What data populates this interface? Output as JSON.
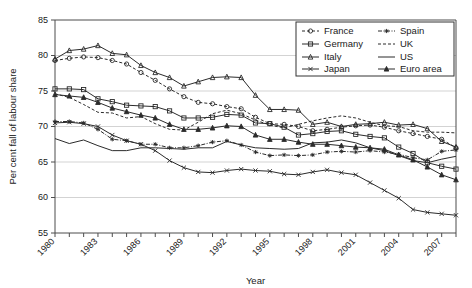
{
  "chart_data": {
    "type": "line",
    "title": "",
    "xlabel": "Year",
    "ylabel": "Per cent fall of labour share",
    "xlim": [
      1980,
      2008
    ],
    "ylim": [
      55,
      85
    ],
    "yticks": [
      55,
      60,
      65,
      70,
      75,
      80,
      85
    ],
    "xticks": [
      1980,
      1981,
      1982,
      1983,
      1984,
      1985,
      1986,
      1987,
      1988,
      1989,
      1990,
      1991,
      1992,
      1993,
      1994,
      1995,
      1996,
      1997,
      1998,
      1999,
      2000,
      2001,
      2002,
      2003,
      2004,
      2005,
      2006,
      2007,
      2008
    ],
    "xtick_labels": [
      "1980",
      "",
      "",
      "1983",
      "",
      "",
      "1986",
      "",
      "",
      "1989",
      "",
      "",
      "1992",
      "",
      "",
      "1995",
      "",
      "",
      "1998",
      "",
      "",
      "2001",
      "",
      "",
      "2004",
      "",
      "",
      "2007",
      ""
    ],
    "grid": "horizontal",
    "legend_position": "top-right",
    "x": [
      1980,
      1981,
      1982,
      1983,
      1984,
      1985,
      1986,
      1987,
      1988,
      1989,
      1990,
      1991,
      1992,
      1993,
      1994,
      1995,
      1996,
      1997,
      1998,
      1999,
      2000,
      2001,
      2002,
      2003,
      2004,
      2005,
      2006,
      2007,
      2008
    ],
    "series": [
      {
        "name": "France",
        "marker": "circle-open",
        "line_style": "dashed",
        "values": [
          79.3,
          79.6,
          79.8,
          79.7,
          79.3,
          78.8,
          77.6,
          76.5,
          75.3,
          74.2,
          73.4,
          73.2,
          72.8,
          72.5,
          71.3,
          70.4,
          70.3,
          70.0,
          69.4,
          69.6,
          69.9,
          70.1,
          70.2,
          69.9,
          69.4,
          69.0,
          68.6,
          68.2,
          67.0
        ]
      },
      {
        "name": "Germany",
        "marker": "square-open",
        "line_style": "solid",
        "values": [
          75.3,
          75.3,
          75.2,
          73.9,
          73.5,
          73.0,
          72.9,
          72.8,
          72.2,
          71.2,
          71.2,
          71.3,
          71.7,
          71.6,
          70.5,
          70.4,
          69.9,
          68.8,
          69.0,
          69.3,
          69.4,
          68.9,
          68.6,
          68.4,
          67.1,
          66.2,
          64.9,
          64.4,
          64.0
        ]
      },
      {
        "name": "Italy",
        "marker": "triangle-open",
        "line_style": "solid",
        "values": [
          79.5,
          80.7,
          80.9,
          81.4,
          80.3,
          80.1,
          78.6,
          77.6,
          76.9,
          75.7,
          76.3,
          76.9,
          77.0,
          76.9,
          74.4,
          72.4,
          72.4,
          72.3,
          70.3,
          70.6,
          70.0,
          70.3,
          70.4,
          70.6,
          70.2,
          70.3,
          69.7,
          67.9,
          67.1
        ]
      },
      {
        "name": "Japan",
        "marker": "x",
        "line_style": "solid",
        "values": [
          70.5,
          70.6,
          70.4,
          70.0,
          68.8,
          68.0,
          67.5,
          66.6,
          65.2,
          64.2,
          63.6,
          63.5,
          63.8,
          64.0,
          63.8,
          63.7,
          63.3,
          63.2,
          63.6,
          63.9,
          63.5,
          63.2,
          62.1,
          61.0,
          59.9,
          58.3,
          57.9,
          57.7,
          57.5
        ]
      },
      {
        "name": "Spain",
        "marker": "star",
        "line_style": "dash-dot",
        "values": [
          70.7,
          70.7,
          70.5,
          69.6,
          68.2,
          68.0,
          67.5,
          67.5,
          67.0,
          67.0,
          67.3,
          67.8,
          68.0,
          67.4,
          66.4,
          65.9,
          66.0,
          65.9,
          66.0,
          66.4,
          66.5,
          66.4,
          66.6,
          66.4,
          66.1,
          65.6,
          65.3,
          66.5,
          66.7
        ]
      },
      {
        "name": "UK",
        "marker": "none",
        "line_style": "dashed",
        "values": [
          74.6,
          74.1,
          73.1,
          72.0,
          71.9,
          71.2,
          71.4,
          70.4,
          69.6,
          69.5,
          70.6,
          71.8,
          72.3,
          71.8,
          70.9,
          70.2,
          69.8,
          70.3,
          70.8,
          71.2,
          71.5,
          71.2,
          70.6,
          70.1,
          70.0,
          69.4,
          69.2,
          69.2,
          69.1
        ]
      },
      {
        "name": "US",
        "marker": "none",
        "line_style": "solid",
        "values": [
          68.3,
          67.6,
          68.1,
          67.3,
          66.6,
          66.6,
          67.0,
          67.0,
          66.9,
          66.8,
          67.0,
          67.0,
          67.9,
          67.4,
          67.0,
          66.9,
          66.8,
          66.9,
          67.7,
          67.8,
          68.1,
          67.7,
          67.0,
          66.6,
          65.9,
          65.2,
          64.9,
          65.4,
          65.8
        ]
      },
      {
        "name": "Euro area",
        "marker": "triangle-filled",
        "line_style": "solid",
        "values": [
          74.5,
          74.3,
          74.1,
          73.4,
          72.6,
          72.1,
          71.6,
          71.2,
          70.3,
          69.6,
          69.6,
          69.8,
          70.1,
          70.0,
          68.8,
          68.2,
          68.2,
          67.8,
          67.5,
          67.5,
          67.3,
          67.1,
          67.0,
          66.8,
          66.0,
          65.3,
          64.3,
          63.2,
          62.5
        ]
      }
    ]
  },
  "legend": {
    "entries": [
      {
        "label": "France"
      },
      {
        "label": "Germany"
      },
      {
        "label": "Italy"
      },
      {
        "label": "Japan"
      },
      {
        "label": "Spain"
      },
      {
        "label": "UK"
      },
      {
        "label": "US"
      },
      {
        "label": "Euro area"
      }
    ]
  },
  "colors": {
    "line": "#2b2b2b",
    "axis": "#4d4d4d",
    "grid": "#c8c8c8",
    "background": "#ffffff"
  }
}
